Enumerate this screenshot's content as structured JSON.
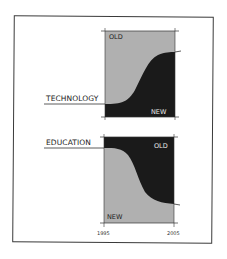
{
  "diagrams": [
    {
      "row_label": "TECHNOLOGY",
      "top_region_label": "OLD",
      "bottom_region_label": "NEW",
      "top_color": "#b0b0b0",
      "bottom_color": "#1a1a1a",
      "trend": "new rises from low to high"
    },
    {
      "row_label": "EDUCATION",
      "top_region_label": "OLD",
      "bottom_region_label": "NEW",
      "top_color": "#1a1a1a",
      "bottom_color": "#b0b0b0",
      "trend": "new falls... old grows"
    }
  ],
  "x_axis": {
    "start_label": "1995",
    "end_label": "2005"
  }
}
